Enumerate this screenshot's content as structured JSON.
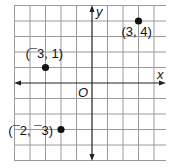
{
  "chart_data": {
    "type": "scatter",
    "title": "",
    "xlabel": "x",
    "ylabel": "y",
    "origin_label": "O",
    "xlim": [
      -5,
      4.75
    ],
    "ylim": [
      -5,
      5
    ],
    "grid": true,
    "grid_step": 1,
    "points": [
      {
        "x": 3,
        "y": 4,
        "label": "(3, 4)"
      },
      {
        "x": -3,
        "y": 1,
        "label": "(¯3, 1)"
      },
      {
        "x": -2,
        "y": -3,
        "label": "(¯2, ¯3)"
      }
    ]
  },
  "colors": {
    "grid": "#9a9a9a",
    "axis": "#222222",
    "point": "#111111"
  }
}
